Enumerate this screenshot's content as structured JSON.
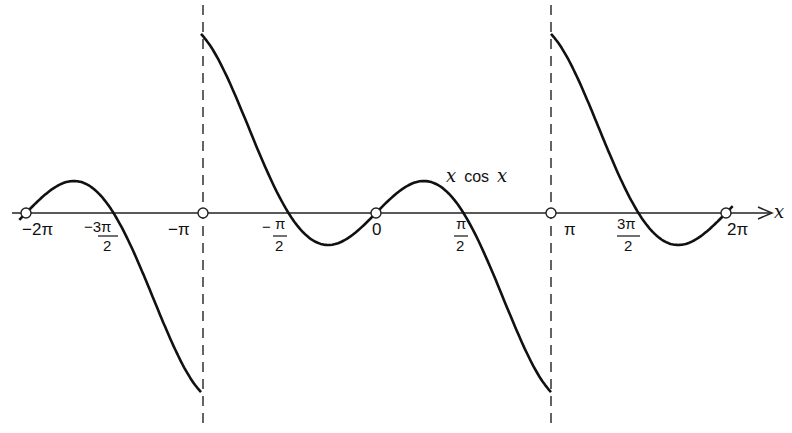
{
  "chart_data": {
    "type": "line",
    "title": "",
    "function": "x cos x (periodic extension, period 2π)",
    "series": [
      {
        "name": "x cos x",
        "domain": [
          -6.2832,
          6.2832
        ],
        "periodic_interval": [
          -3.1416,
          3.1416
        ],
        "discontinuities_at": [
          -3.1416,
          3.1416
        ],
        "sample_points": [
          {
            "x": -6.2832,
            "y": 0
          },
          {
            "x": -5.4,
            "y": 0.56
          },
          {
            "x": -4.7124,
            "y": 0
          },
          {
            "x": -3.1416,
            "y": -3.1416
          },
          {
            "x": -3.1416,
            "y": 3.1416
          },
          {
            "x": -1.5708,
            "y": 0
          },
          {
            "x": -0.86,
            "y": -0.56
          },
          {
            "x": 0,
            "y": 0
          },
          {
            "x": 0.86,
            "y": 0.56
          },
          {
            "x": 1.5708,
            "y": 0
          },
          {
            "x": 3.1416,
            "y": -3.1416
          },
          {
            "x": 3.1416,
            "y": 3.1416
          },
          {
            "x": 4.7124,
            "y": 0
          },
          {
            "x": 5.4,
            "y": -0.56
          },
          {
            "x": 6.2832,
            "y": 0
          }
        ]
      }
    ],
    "xlabel": "x",
    "ylabel": "",
    "x_ticks": [
      "−2π",
      "−3π/2",
      "−π",
      "−π/2",
      "0",
      "π/2",
      "π",
      "3π/2",
      "2π"
    ],
    "open_circles_at": [
      "−2π",
      "−π",
      "0",
      "π",
      "2π"
    ],
    "dashed_asymptotes_at": [
      "−π",
      "π"
    ],
    "annotations": [
      "x cos x"
    ],
    "grid": false,
    "legend": "none"
  },
  "labels": {
    "axis_var": "x",
    "curve_label_var1": "x",
    "curve_label_mid": "cos",
    "curve_label_var2": "x",
    "neg_two_pi": "−2π",
    "neg_three_pi_num": "−3π",
    "neg_three_pi_den": "2",
    "neg_pi": "−π",
    "neg_half_pi_num": "π",
    "neg_half_pi_sign": "−",
    "neg_half_pi_den": "2",
    "zero": "0",
    "half_pi_num": "π",
    "half_pi_den": "2",
    "pi": "π",
    "three_half_pi_num": "3π",
    "three_half_pi_den": "2",
    "two_pi": "2π"
  }
}
